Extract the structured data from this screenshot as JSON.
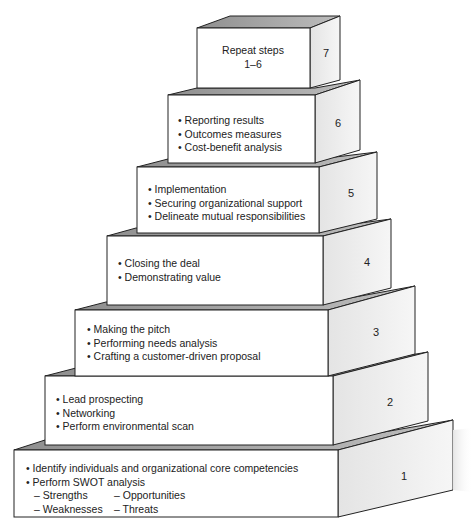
{
  "diagram": {
    "type": "stepped-pyramid",
    "steps": [
      {
        "number": "7",
        "lines": [
          "Repeat steps",
          "1–6"
        ]
      },
      {
        "number": "6",
        "bullets": [
          "Reporting results",
          "Outcomes measures",
          "Cost-benefit analysis"
        ]
      },
      {
        "number": "5",
        "bullets": [
          "Implementation",
          "Securing organizational support",
          "Delineate mutual responsibilities"
        ]
      },
      {
        "number": "4",
        "bullets": [
          "Closing the deal",
          "Demonstrating value"
        ]
      },
      {
        "number": "3",
        "bullets": [
          "Making the pitch",
          "Performing needs analysis",
          "Crafting a customer-driven proposal"
        ]
      },
      {
        "number": "2",
        "bullets": [
          "Lead prospecting",
          "Networking",
          "Perform environmental scan"
        ]
      },
      {
        "number": "1",
        "bullets": [
          "Identify individuals and organizational core competencies",
          "Perform SWOT analysis"
        ],
        "subitems": [
          [
            "– Strengths",
            "– Opportunities"
          ],
          [
            "– Weaknesses",
            "– Threats"
          ]
        ]
      }
    ],
    "colors": {
      "front": "#ffffff",
      "side_light": "#f2f2f2",
      "side_dark": "#cfcfcf",
      "top": "#a9a9a9",
      "outline": "#222222"
    }
  }
}
